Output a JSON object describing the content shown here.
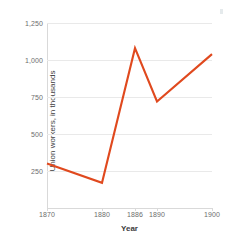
{
  "chart_data": {
    "type": "line",
    "title": "",
    "xlabel": "Year",
    "ylabel": "Union workers, in thousands",
    "x": [
      1870,
      1880,
      1886,
      1890,
      1900
    ],
    "values": [
      300,
      170,
      1080,
      720,
      1040
    ],
    "series": [
      {
        "name": "Union workers",
        "values": [
          300,
          170,
          1080,
          720,
          1040
        ],
        "color": "#e0491e"
      }
    ],
    "xlim": [
      1870,
      1900
    ],
    "ylim": [
      0,
      1250
    ],
    "xticks": [
      1870,
      1880,
      1886,
      1890,
      1900
    ],
    "xtick_labels": [
      "1870",
      "1880",
      "1886",
      "1890",
      "1900"
    ],
    "yticks": [
      250,
      500,
      750,
      1000,
      1250
    ],
    "ytick_labels": [
      "250",
      "500",
      "750",
      "1,000",
      "1,250"
    ],
    "grid": true,
    "grid_axis": "y",
    "legend": false,
    "legend_position": "none",
    "line_color": "#e0491e",
    "grid_color": "#e9e9e9",
    "axis_color": "#d9d9d9",
    "tick_label_color": "#6d6d6d",
    "axis_title_color": "#3d3d3d",
    "background": "#ffffff"
  }
}
